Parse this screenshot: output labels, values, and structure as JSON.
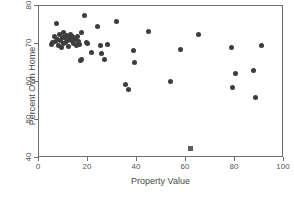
{
  "chart_data": {
    "type": "scatter",
    "title": "",
    "xlabel": "Property Value",
    "ylabel": "Percent Own Home",
    "xlim": [
      0,
      100
    ],
    "ylim": [
      40,
      80
    ],
    "xticks": [
      0,
      20,
      40,
      60,
      80,
      100
    ],
    "yticks": [
      40,
      50,
      60,
      70,
      80
    ],
    "grid": false,
    "legend": null,
    "marker_color": "#3d3d3d",
    "outlier_color": "#5c5c5c",
    "series": [
      {
        "name": "states",
        "marker": "circle",
        "points": [
          [
            4.9,
            69.8
          ],
          [
            5.6,
            70.3
          ],
          [
            6.2,
            72.0
          ],
          [
            6.6,
            70.6
          ],
          [
            7.1,
            75.3
          ],
          [
            7.4,
            71.2
          ],
          [
            7.8,
            69.6
          ],
          [
            8.2,
            72.4
          ],
          [
            8.6,
            70.9
          ],
          [
            9.0,
            69.0
          ],
          [
            9.4,
            71.6
          ],
          [
            9.8,
            70.2
          ],
          [
            10.2,
            73.0
          ],
          [
            10.6,
            71.8
          ],
          [
            11.0,
            70.4
          ],
          [
            11.4,
            72.2
          ],
          [
            11.8,
            71.0
          ],
          [
            12.1,
            69.3
          ],
          [
            12.5,
            71.4
          ],
          [
            12.9,
            72.6
          ],
          [
            13.3,
            70.8
          ],
          [
            13.8,
            71.9
          ],
          [
            14.2,
            70.1
          ],
          [
            14.7,
            71.3
          ],
          [
            15.2,
            69.5
          ],
          [
            15.6,
            72.0
          ],
          [
            16.1,
            70.7
          ],
          [
            16.5,
            69.9
          ],
          [
            17.0,
            65.7
          ],
          [
            17.4,
            65.9
          ],
          [
            17.3,
            73.1
          ],
          [
            18.6,
            77.4
          ],
          [
            19.2,
            70.5
          ],
          [
            19.8,
            70.2
          ],
          [
            21.5,
            67.8
          ],
          [
            23.8,
            74.6
          ],
          [
            24.9,
            69.5
          ],
          [
            25.6,
            67.6
          ],
          [
            26.9,
            65.9
          ],
          [
            28.0,
            69.8
          ],
          [
            31.5,
            76.0
          ],
          [
            35.2,
            59.3
          ],
          [
            36.6,
            58.1
          ],
          [
            38.4,
            68.4
          ],
          [
            38.8,
            65.2
          ],
          [
            44.6,
            73.4
          ],
          [
            53.8,
            60.2
          ],
          [
            57.8,
            68.5
          ],
          [
            65.2,
            72.6
          ],
          [
            78.6,
            69.1
          ],
          [
            78.8,
            58.5
          ],
          [
            80.1,
            62.2
          ],
          [
            87.4,
            62.9
          ],
          [
            88.2,
            55.8
          ],
          [
            91.0,
            69.6
          ]
        ]
      },
      {
        "name": "outlier",
        "marker": "square",
        "points": [
          [
            61.8,
            42.5
          ]
        ]
      }
    ]
  }
}
